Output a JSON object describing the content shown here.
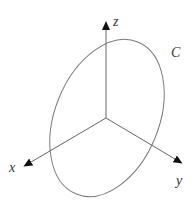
{
  "diagram": {
    "type": "3d-axes-with-curve",
    "origin": [
      106,
      118
    ],
    "axes": [
      {
        "name": "z",
        "label": "z",
        "tip": [
          106,
          20
        ],
        "label_pos": [
          113,
          26
        ]
      },
      {
        "name": "x",
        "label": "x",
        "tip": [
          22,
          167
        ],
        "label_pos": [
          9,
          172
        ]
      },
      {
        "name": "y",
        "label": "y",
        "tip": [
          184,
          164
        ],
        "label_pos": [
          176,
          185
        ]
      }
    ],
    "curve": {
      "label": "C",
      "label_pos": [
        171,
        57
      ],
      "shape": "ellipse",
      "center": [
        107,
        118
      ],
      "rx": 52,
      "ry": 82,
      "rotation_deg": 22
    },
    "colors": {
      "axis": "#666666",
      "arrowhead": "#111111",
      "curve": "#7a7a7a",
      "text": "#333333"
    }
  }
}
